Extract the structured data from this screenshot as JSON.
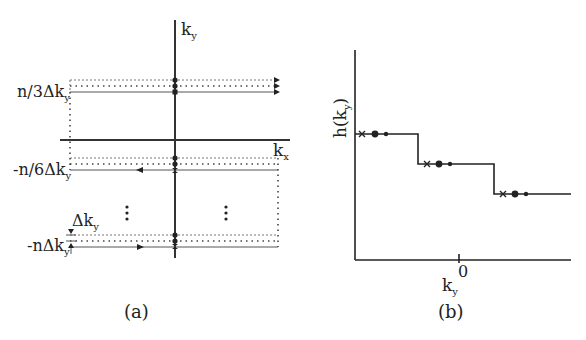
{
  "panel_a": {
    "caption": "(a)",
    "axis_x_label": "k",
    "axis_x_sub": "x",
    "axis_y_label": "k",
    "axis_y_sub": "y",
    "row_labels": [
      {
        "text": "n/3Δk",
        "sub": "y"
      },
      {
        "text": "-n/6Δk",
        "sub": "y"
      },
      {
        "text": "-nΔk",
        "sub": "y"
      }
    ],
    "spacing_label": {
      "text": "Δk",
      "sub": "y"
    },
    "ellipsis": "⋮"
  },
  "panel_b": {
    "caption": "(b)",
    "y_label": "h(k",
    "y_label_sub": "y",
    "y_label_close": ")",
    "x_label": "k",
    "x_label_sub": "y",
    "x_tick": "0",
    "steps": 3,
    "markers_per_step": [
      "cross",
      "large-dot",
      "small-dot"
    ]
  },
  "colors": {
    "line": "#222222",
    "dotted": "#777777",
    "background": "#ffffff"
  }
}
